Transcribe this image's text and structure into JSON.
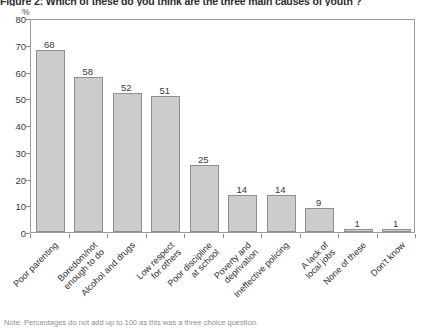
{
  "figure": {
    "title": "Figure 2: Which of these do you think are the three main causes of youth ?",
    "footnote": "Note: Percentages do not add up to 100 as this was a three choice question.",
    "y_unit": "%"
  },
  "chart_data": {
    "type": "bar",
    "title": "Figure 2: Which of these do you think are the three main causes of youth ?",
    "xlabel": "",
    "ylabel": "%",
    "ylim": [
      0,
      80
    ],
    "yticks": [
      0,
      10,
      20,
      30,
      40,
      50,
      60,
      70,
      80
    ],
    "ytick_labels": [
      "0",
      "10",
      "20",
      "30",
      "40",
      "50",
      "60",
      "70",
      "80"
    ],
    "grid": false,
    "legend": false,
    "bar_color": "#cccccc",
    "bar_border_color": "#8f8f8f",
    "categories": [
      "Poor parenting",
      "Boredom/not\nenough to do",
      "Alcohol and drugs",
      "Low respect\nfor others",
      "Poor discipline\nat school",
      "Poverty and\ndeprivation",
      "Ineffective policing",
      "A lack of\nlocal jobs",
      "None of these",
      "Don't know"
    ],
    "values": [
      68,
      58,
      52,
      51,
      25,
      14,
      14,
      9,
      1,
      1
    ],
    "value_labels": [
      "68",
      "58",
      "52",
      "51",
      "25",
      "14",
      "14",
      "9",
      "1",
      "1"
    ]
  }
}
